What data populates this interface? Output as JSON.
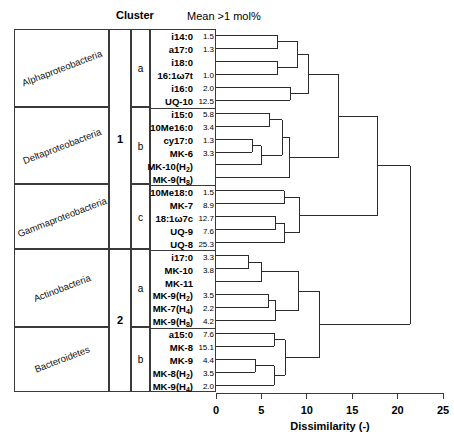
{
  "headers": {
    "cluster": "Cluster",
    "mean": "Mean >1 mol%"
  },
  "taxa": [
    {
      "name": "Alphaproteobacteria"
    },
    {
      "name": "Deltaproteobacteria"
    },
    {
      "name": "Gammaproteobacteria"
    },
    {
      "name": "Actinobacteria"
    },
    {
      "name": "Bacteroidetes"
    }
  ],
  "clusters": {
    "major": [
      {
        "label": "1",
        "start": 0,
        "end": 16
      },
      {
        "label": "2",
        "start": 17,
        "end": 27
      }
    ],
    "minor": [
      {
        "label": "a",
        "start": 0,
        "end": 5
      },
      {
        "label": "b",
        "start": 6,
        "end": 11
      },
      {
        "label": "c",
        "start": 12,
        "end": 16
      },
      {
        "label": "a",
        "start": 17,
        "end": 22
      },
      {
        "label": "b",
        "start": 23,
        "end": 27
      }
    ]
  },
  "leaves": [
    {
      "name": "i14:0",
      "value": "1.5"
    },
    {
      "name": "a17:0",
      "value": "1.3"
    },
    {
      "name": "i18:0",
      "value": ""
    },
    {
      "name": "16:1ω7t",
      "value": "1.0"
    },
    {
      "name": "i16:0",
      "value": "2.0"
    },
    {
      "name": "UQ-10",
      "value": "12.5"
    },
    {
      "name": "i15:0",
      "value": "5.8"
    },
    {
      "name": "10Me16:0",
      "value": "3.4"
    },
    {
      "name": "cy17:0",
      "value": "1.3"
    },
    {
      "name": "MK-6",
      "value": "3.3"
    },
    {
      "name": "MK-10(H2)",
      "value": ""
    },
    {
      "name": "MK-9(H8)",
      "value": ""
    },
    {
      "name": "10Me18:0",
      "value": "1.5"
    },
    {
      "name": "MK-7",
      "value": "8.9"
    },
    {
      "name": "18:1ω7c",
      "value": "12.7"
    },
    {
      "name": "UQ-9",
      "value": "7.6"
    },
    {
      "name": "UQ-8",
      "value": "25.3"
    },
    {
      "name": "i17:0",
      "value": "3.3"
    },
    {
      "name": "MK-10",
      "value": "3.8"
    },
    {
      "name": "MK-11",
      "value": ""
    },
    {
      "name": "MK-9(H2)",
      "value": "3.5"
    },
    {
      "name": "MK-7(H4)",
      "value": "2.2"
    },
    {
      "name": "MK-9(H8)",
      "value": "4.2"
    },
    {
      "name": "a15:0",
      "value": "7.6"
    },
    {
      "name": "MK-8",
      "value": "15.1"
    },
    {
      "name": "MK-9",
      "value": "4.4"
    },
    {
      "name": "MK-8(H2)",
      "value": "3.5"
    },
    {
      "name": "MK-9(H4)",
      "value": "2.0"
    }
  ],
  "axis": {
    "title": "Dissimilarity (-)",
    "ticks": [
      "0",
      "5",
      "10",
      "15",
      "20",
      "25"
    ],
    "min": 0,
    "max": 25
  },
  "chart_data": {
    "type": "dendrogram",
    "title": "",
    "xlabel": "Dissimilarity (-)",
    "ylabel": "",
    "xlim": [
      0,
      25
    ],
    "grid": false,
    "legend": "none",
    "leaf_order": [
      "i14:0",
      "a17:0",
      "i18:0",
      "16:1ω7t",
      "i16:0",
      "UQ-10",
      "i15:0",
      "10Me16:0",
      "cy17:0",
      "MK-6",
      "MK-10(H2)",
      "MK-9(H8)",
      "10Me18:0",
      "MK-7",
      "18:1ω7c",
      "UQ-9",
      "UQ-8",
      "i17:0",
      "MK-10",
      "MK-11",
      "MK-9(H2)",
      "MK-7(H4)",
      "MK-9(H8)",
      "a15:0",
      "MK-8",
      "MK-9",
      "MK-8(H2)",
      "MK-9(H4)"
    ],
    "leaf_values": [
      1.5,
      1.3,
      null,
      1.0,
      2.0,
      12.5,
      5.8,
      3.4,
      1.3,
      3.3,
      null,
      null,
      1.5,
      8.9,
      12.7,
      7.6,
      25.3,
      3.3,
      3.8,
      null,
      3.5,
      2.2,
      4.2,
      7.6,
      15.1,
      4.4,
      3.5,
      2.0
    ],
    "group_labels": [
      "Alphaproteobacteria",
      "Deltaproteobacteria",
      "Gammaproteobacteria",
      "Actinobacteria",
      "Bacteroidetes"
    ],
    "group_leaf_counts": [
      6,
      6,
      5,
      6,
      5
    ],
    "cluster_assignment": [
      "1a",
      "1a",
      "1a",
      "1a",
      "1a",
      "1a",
      "1b",
      "1b",
      "1b",
      "1b",
      "1b",
      "1b",
      "1c",
      "1c",
      "1c",
      "1c",
      "1c",
      "2a",
      "2a",
      "2a",
      "2a",
      "2a",
      "2a",
      "2b",
      "2b",
      "2b",
      "2b",
      "2b"
    ],
    "merges": [
      {
        "id": "m1",
        "left": "i14:0",
        "right": "a17:0",
        "height": 6.8
      },
      {
        "id": "m2",
        "left": "i18:0",
        "right": "16:1ω7t",
        "height": 6.8
      },
      {
        "id": "m3",
        "left": "m1",
        "right": "m2",
        "height": 9.0
      },
      {
        "id": "m4",
        "left": "i16:0",
        "right": "UQ-10",
        "height": 8.2
      },
      {
        "id": "m5",
        "left": "m3",
        "right": "m4",
        "height": 10.2
      },
      {
        "id": "m6",
        "left": "i15:0",
        "right": "10Me16:0",
        "height": 5.9
      },
      {
        "id": "m7",
        "left": "cy17:0",
        "right": "MK-6",
        "height": 4.0
      },
      {
        "id": "m8",
        "left": "m7",
        "right": "MK-10(H2)",
        "height": 5.0
      },
      {
        "id": "m9",
        "left": "m6",
        "right": "m8",
        "height": 7.3
      },
      {
        "id": "m10",
        "left": "m9",
        "right": "MK-9(H8)",
        "height": 8.1
      },
      {
        "id": "m11",
        "left": "m5",
        "right": "m10",
        "height": 13.5
      },
      {
        "id": "m12",
        "left": "10Me18:0",
        "right": "MK-7",
        "height": 7.5
      },
      {
        "id": "m13",
        "left": "18:1ω7c",
        "right": "UQ-9",
        "height": 6.6
      },
      {
        "id": "m14",
        "left": "m13",
        "right": "UQ-8",
        "height": 7.5
      },
      {
        "id": "m15",
        "left": "m12",
        "right": "m14",
        "height": 9.2
      },
      {
        "id": "m16",
        "left": "m11",
        "right": "m15",
        "height": 17.8
      },
      {
        "id": "m17",
        "left": "i17:0",
        "right": "MK-10",
        "height": 3.6
      },
      {
        "id": "m18",
        "left": "m17",
        "right": "MK-11",
        "height": 5.0
      },
      {
        "id": "m19",
        "left": "MK-9(H2)",
        "right": "MK-7(H4)",
        "height": 5.8
      },
      {
        "id": "m20",
        "left": "m19",
        "right": "MK-9(H8)",
        "height": 6.6
      },
      {
        "id": "m21",
        "left": "m18",
        "right": "m20",
        "height": 9.1
      },
      {
        "id": "m22",
        "left": "a15:0",
        "right": "MK-8",
        "height": 6.4
      },
      {
        "id": "m23",
        "left": "MK-9",
        "right": "MK-8(H2)",
        "height": 4.3
      },
      {
        "id": "m24",
        "left": "m23",
        "right": "MK-9(H4)",
        "height": 6.4
      },
      {
        "id": "m25",
        "left": "m22",
        "right": "m24",
        "height": 7.6
      },
      {
        "id": "m26",
        "left": "m21",
        "right": "m25",
        "height": 11.4
      },
      {
        "id": "m27",
        "left": "m16",
        "right": "m26",
        "height": 21.4
      }
    ]
  }
}
